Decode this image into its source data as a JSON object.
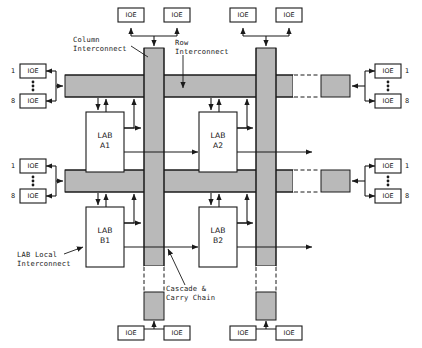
{
  "diagram": {
    "colors": {
      "interconnect_fill": "#b9b9b9",
      "line": "#1a1a1a",
      "background": "#ffffff"
    },
    "annotations": [
      {
        "id": "column-interconnect",
        "line1": "Column",
        "line2": "Interconnect"
      },
      {
        "id": "row-interconnect",
        "line1": "Row",
        "line2": "Interconnect"
      },
      {
        "id": "lab-local-interconnect",
        "line1": "LAB Local",
        "line2": "Interconnect"
      },
      {
        "id": "cascade-carry-chain",
        "line1": "Cascade &",
        "line2": "Carry Chain"
      }
    ],
    "labs": [
      {
        "id": "lab-a1",
        "line1": "LAB",
        "line2": "A1"
      },
      {
        "id": "lab-a2",
        "line1": "LAB",
        "line2": "A2"
      },
      {
        "id": "lab-b1",
        "line1": "LAB",
        "line2": "B1"
      },
      {
        "id": "lab-b2",
        "line1": "LAB",
        "line2": "B2"
      }
    ],
    "ioe_label": "IOE",
    "ioe_blocks": {
      "top_left": [
        {
          "label": "IOE"
        },
        {
          "label": "IOE"
        }
      ],
      "top_right": [
        {
          "label": "IOE"
        },
        {
          "label": "IOE"
        }
      ],
      "bottom_left": [
        {
          "label": "IOE"
        },
        {
          "label": "IOE"
        }
      ],
      "bottom_right": [
        {
          "label": "IOE"
        },
        {
          "label": "IOE"
        }
      ],
      "left_upper": [
        {
          "label": "IOE",
          "index": "1"
        },
        {
          "label": "IOE",
          "index": "8"
        }
      ],
      "left_lower": [
        {
          "label": "IOE",
          "index": "1"
        },
        {
          "label": "IOE",
          "index": "8"
        }
      ],
      "right_upper": [
        {
          "label": "IOE",
          "index": "1"
        },
        {
          "label": "IOE",
          "index": "8"
        }
      ],
      "right_lower": [
        {
          "label": "IOE",
          "index": "1"
        },
        {
          "label": "IOE",
          "index": "8"
        }
      ]
    },
    "channel_indices": {
      "first": "1",
      "last": "8"
    }
  }
}
